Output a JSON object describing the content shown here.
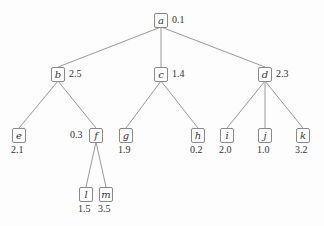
{
  "tree": {
    "nodes": [
      {
        "id": "a",
        "label": "a",
        "value": "0.1",
        "x": 161,
        "y": 20,
        "pos": "right"
      },
      {
        "id": "b",
        "label": "b",
        "value": "2.5",
        "x": 58,
        "y": 74,
        "pos": "right"
      },
      {
        "id": "c",
        "label": "c",
        "value": "1.4",
        "x": 161,
        "y": 74,
        "pos": "right"
      },
      {
        "id": "d",
        "label": "d",
        "value": "2.3",
        "x": 265,
        "y": 74,
        "pos": "right"
      },
      {
        "id": "e",
        "label": "e",
        "value": "2.1",
        "x": 19,
        "y": 135,
        "pos": "below"
      },
      {
        "id": "f",
        "label": "f",
        "value": "0.3",
        "x": 96,
        "y": 135,
        "pos": "left"
      },
      {
        "id": "g",
        "label": "g",
        "value": "1.9",
        "x": 126,
        "y": 135,
        "pos": "below"
      },
      {
        "id": "h",
        "label": "h",
        "value": "0.2",
        "x": 198,
        "y": 135,
        "pos": "below"
      },
      {
        "id": "i",
        "label": "i",
        "value": "2.0",
        "x": 227,
        "y": 135,
        "pos": "below"
      },
      {
        "id": "j",
        "label": "j",
        "value": "1.0",
        "x": 265,
        "y": 135,
        "pos": "below"
      },
      {
        "id": "k",
        "label": "k",
        "value": "3.2",
        "x": 303,
        "y": 135,
        "pos": "below"
      },
      {
        "id": "l",
        "label": "l",
        "value": "1.5",
        "x": 86,
        "y": 194,
        "pos": "below"
      },
      {
        "id": "m",
        "label": "m",
        "value": "3.5",
        "x": 106,
        "y": 194,
        "pos": "below"
      }
    ],
    "edges": [
      [
        "a",
        "b"
      ],
      [
        "a",
        "c"
      ],
      [
        "a",
        "d"
      ],
      [
        "b",
        "e"
      ],
      [
        "b",
        "f"
      ],
      [
        "c",
        "g"
      ],
      [
        "c",
        "h"
      ],
      [
        "d",
        "i"
      ],
      [
        "d",
        "j"
      ],
      [
        "d",
        "k"
      ],
      [
        "f",
        "l"
      ],
      [
        "f",
        "m"
      ]
    ],
    "colors": {
      "edge": "#9a9a9a",
      "border": "#8a8a8a",
      "text": "#333333"
    }
  }
}
